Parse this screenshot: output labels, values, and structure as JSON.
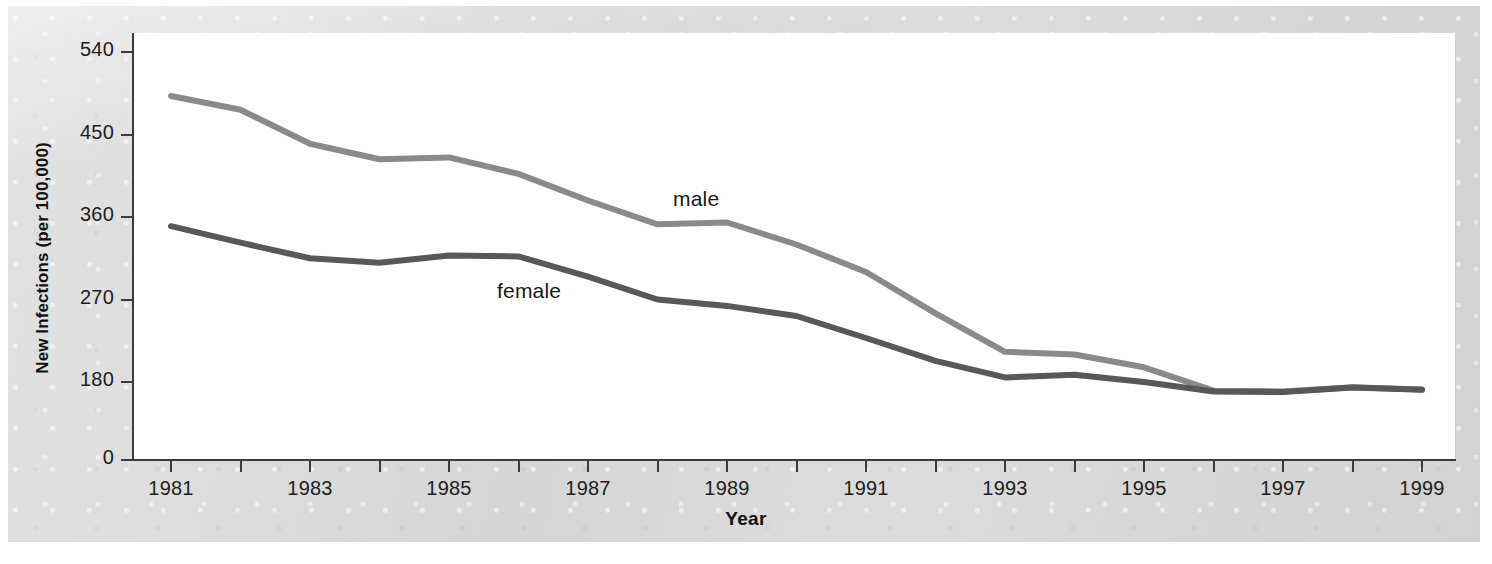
{
  "chart_data": {
    "type": "line",
    "title": "",
    "xlabel": "Year",
    "ylabel": "New Infections (per 100,000)",
    "x": [
      1981,
      1982,
      1983,
      1984,
      1985,
      1986,
      1987,
      1988,
      1989,
      1990,
      1991,
      1992,
      1993,
      1994,
      1995,
      1996,
      1997,
      1998,
      1999
    ],
    "xtick_labels": [
      "1981",
      "",
      "1983",
      "",
      "1985",
      "",
      "1987",
      "",
      "1989",
      "",
      "1991",
      "",
      "1993",
      "",
      "1995",
      "",
      "1997",
      "",
      "1999"
    ],
    "xlim": [
      1981,
      1999
    ],
    "ytick_labels": [
      "540",
      "450",
      "360",
      "270",
      "180",
      "0"
    ],
    "yticks": [
      540,
      450,
      360,
      270,
      180,
      0
    ],
    "ylim": [
      0,
      560
    ],
    "y_axis_note": "axis is broken between 0 and 180",
    "grid": false,
    "legend": "inline-labels",
    "series": [
      {
        "name": "male",
        "color": "#8a8a8a",
        "values": [
          492,
          477,
          440,
          423,
          425,
          407,
          378,
          352,
          354,
          330,
          300,
          255,
          213,
          210,
          196,
          160,
          158,
          168,
          163
        ]
      },
      {
        "name": "female",
        "color": "#585858",
        "values": [
          350,
          332,
          315,
          310,
          318,
          317,
          295,
          270,
          263,
          252,
          228,
          203,
          185,
          188,
          180,
          158,
          157,
          167,
          162
        ]
      }
    ]
  },
  "axis": {
    "x_title": "Year",
    "y_title": "New Infections (per 100,000)"
  },
  "labels": {
    "male": "male",
    "female": "female"
  }
}
